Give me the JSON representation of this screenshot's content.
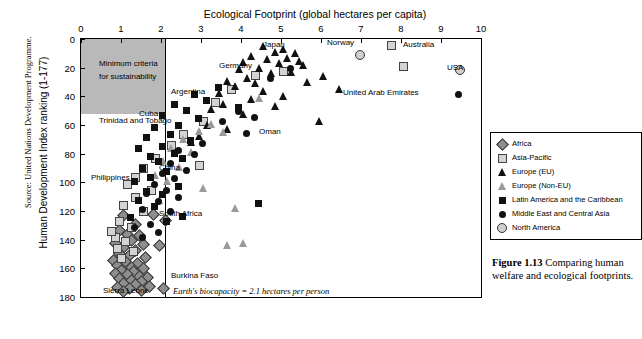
{
  "source": "Source: United Nations Development Programme.",
  "chart_data": {
    "type": "scatter",
    "title": "Ecological Footprint (global hectares per capita)",
    "xlabel": "Ecological Footprint (global hectares per capita)",
    "ylabel": "Human Development Index ranking (1-177)",
    "xlim": [
      0,
      10
    ],
    "ylim": [
      180,
      0
    ],
    "xticks": [
      0,
      1,
      2,
      3,
      4,
      5,
      6,
      7,
      8,
      9,
      10
    ],
    "yticks": [
      0,
      20,
      40,
      60,
      80,
      100,
      120,
      140,
      160,
      180
    ],
    "grid": false,
    "axis_top": true,
    "legend_position": "right",
    "annotations": [
      {
        "text": "Minimum criteria",
        "x": 0.45,
        "y": 14
      },
      {
        "text": "for sustainability",
        "x": 0.45,
        "y": 23
      },
      {
        "text": "Earth's biocapacity = 2.1 hectares per person",
        "x": 2.3,
        "y": 172
      }
    ],
    "reference_lines": [
      {
        "axis": "x",
        "value": 2.1,
        "label": "Earth's biocapacity = 2.1 hectares per person"
      },
      {
        "axis": "y",
        "value": 150,
        "label": "minimum criteria for sustainability"
      }
    ],
    "series": [
      {
        "name": "Africa",
        "marker": "diamond",
        "points": [
          {
            "x": 1.05,
            "y": 123
          },
          {
            "x": 1.35,
            "y": 129
          },
          {
            "x": 0.95,
            "y": 133
          },
          {
            "x": 1.15,
            "y": 136
          },
          {
            "x": 1.45,
            "y": 137
          },
          {
            "x": 1.25,
            "y": 140
          },
          {
            "x": 0.85,
            "y": 142
          },
          {
            "x": 1.55,
            "y": 143
          },
          {
            "x": 1.05,
            "y": 145
          },
          {
            "x": 1.35,
            "y": 147
          },
          {
            "x": 0.95,
            "y": 149
          },
          {
            "x": 1.2,
            "y": 151
          },
          {
            "x": 1.6,
            "y": 152
          },
          {
            "x": 0.8,
            "y": 154
          },
          {
            "x": 1.1,
            "y": 155
          },
          {
            "x": 1.4,
            "y": 156
          },
          {
            "x": 0.9,
            "y": 158
          },
          {
            "x": 1.25,
            "y": 159
          },
          {
            "x": 1.55,
            "y": 160
          },
          {
            "x": 1.0,
            "y": 161
          },
          {
            "x": 1.3,
            "y": 162
          },
          {
            "x": 0.85,
            "y": 163
          },
          {
            "x": 1.15,
            "y": 164
          },
          {
            "x": 1.45,
            "y": 165
          },
          {
            "x": 1.65,
            "y": 166
          },
          {
            "x": 0.95,
            "y": 167
          },
          {
            "x": 1.25,
            "y": 168
          },
          {
            "x": 1.5,
            "y": 169
          },
          {
            "x": 1.05,
            "y": 170
          },
          {
            "x": 1.35,
            "y": 171
          },
          {
            "x": 1.7,
            "y": 172
          },
          {
            "x": 0.9,
            "y": 173
          },
          {
            "x": 1.2,
            "y": 174
          },
          {
            "x": 1.5,
            "y": 175
          },
          {
            "x": 1.05,
            "y": 176
          },
          {
            "x": 2.05,
            "y": 174
          },
          {
            "x": 1.8,
            "y": 122
          },
          {
            "x": 2.1,
            "y": 126
          },
          {
            "x": 1.95,
            "y": 144
          }
        ]
      },
      {
        "name": "Asia-Pacific",
        "marker": "square-lt",
        "points": [
          {
            "x": 7.75,
            "y": 4
          },
          {
            "x": 8.05,
            "y": 19
          },
          {
            "x": 5.05,
            "y": 22
          },
          {
            "x": 4.35,
            "y": 25
          },
          {
            "x": 3.75,
            "y": 35
          },
          {
            "x": 3.35,
            "y": 44
          },
          {
            "x": 3.05,
            "y": 57
          },
          {
            "x": 2.55,
            "y": 66
          },
          {
            "x": 2.25,
            "y": 74
          },
          {
            "x": 1.85,
            "y": 83
          },
          {
            "x": 1.55,
            "y": 90
          },
          {
            "x": 1.35,
            "y": 96
          },
          {
            "x": 1.15,
            "y": 101
          },
          {
            "x": 1.75,
            "y": 105
          },
          {
            "x": 1.35,
            "y": 110
          },
          {
            "x": 1.05,
            "y": 116
          },
          {
            "x": 1.55,
            "y": 120
          },
          {
            "x": 0.95,
            "y": 127
          },
          {
            "x": 1.25,
            "y": 131
          },
          {
            "x": 0.85,
            "y": 138
          },
          {
            "x": 1.1,
            "y": 141
          },
          {
            "x": 0.9,
            "y": 146
          },
          {
            "x": 1.3,
            "y": 148
          },
          {
            "x": 1.0,
            "y": 153
          },
          {
            "x": 0.75,
            "y": 134
          },
          {
            "x": 2.95,
            "y": 88
          }
        ]
      },
      {
        "name": "Europe (EU)",
        "marker": "triangle-dk",
        "points": [
          {
            "x": 4.55,
            "y": 5
          },
          {
            "x": 5.05,
            "y": 7
          },
          {
            "x": 4.85,
            "y": 9
          },
          {
            "x": 5.35,
            "y": 10
          },
          {
            "x": 4.25,
            "y": 12
          },
          {
            "x": 5.15,
            "y": 13
          },
          {
            "x": 4.65,
            "y": 14
          },
          {
            "x": 5.45,
            "y": 15
          },
          {
            "x": 4.05,
            "y": 16
          },
          {
            "x": 4.95,
            "y": 17
          },
          {
            "x": 5.55,
            "y": 18
          },
          {
            "x": 4.45,
            "y": 20
          },
          {
            "x": 3.95,
            "y": 21
          },
          {
            "x": 5.25,
            "y": 23
          },
          {
            "x": 4.75,
            "y": 24
          },
          {
            "x": 6.05,
            "y": 26
          },
          {
            "x": 4.15,
            "y": 27
          },
          {
            "x": 3.65,
            "y": 29
          },
          {
            "x": 5.65,
            "y": 30
          },
          {
            "x": 4.35,
            "y": 31
          },
          {
            "x": 3.85,
            "y": 33
          },
          {
            "x": 6.45,
            "y": 35
          },
          {
            "x": 4.55,
            "y": 36
          },
          {
            "x": 3.45,
            "y": 38
          },
          {
            "x": 5.05,
            "y": 40
          },
          {
            "x": 4.25,
            "y": 42
          },
          {
            "x": 3.55,
            "y": 45
          },
          {
            "x": 4.85,
            "y": 47
          },
          {
            "x": 3.25,
            "y": 49
          },
          {
            "x": 4.05,
            "y": 52
          },
          {
            "x": 5.95,
            "y": 57
          },
          {
            "x": 3.15,
            "y": 60
          },
          {
            "x": 3.65,
            "y": 63
          },
          {
            "x": 2.95,
            "y": 68
          },
          {
            "x": 2.75,
            "y": 72
          }
        ]
      },
      {
        "name": "Europe (Non-EU)",
        "marker": "triangle-gy",
        "points": [
          {
            "x": 4.45,
            "y": 41
          },
          {
            "x": 3.25,
            "y": 59
          },
          {
            "x": 2.95,
            "y": 64
          },
          {
            "x": 3.55,
            "y": 65
          },
          {
            "x": 2.55,
            "y": 70
          },
          {
            "x": 2.25,
            "y": 76
          },
          {
            "x": 2.75,
            "y": 79
          },
          {
            "x": 2.05,
            "y": 85
          },
          {
            "x": 2.45,
            "y": 89
          },
          {
            "x": 1.85,
            "y": 95
          },
          {
            "x": 2.15,
            "y": 99
          },
          {
            "x": 3.05,
            "y": 104
          },
          {
            "x": 3.85,
            "y": 118
          },
          {
            "x": 4.05,
            "y": 142
          },
          {
            "x": 3.65,
            "y": 144
          },
          {
            "x": 1.95,
            "y": 112
          }
        ]
      },
      {
        "name": "Latin America and the Caribbean",
        "marker": "square-dk",
        "points": [
          {
            "x": 3.45,
            "y": 34
          },
          {
            "x": 2.85,
            "y": 39
          },
          {
            "x": 3.15,
            "y": 43
          },
          {
            "x": 2.35,
            "y": 46
          },
          {
            "x": 3.95,
            "y": 48
          },
          {
            "x": 2.65,
            "y": 50
          },
          {
            "x": 2.05,
            "y": 54
          },
          {
            "x": 2.95,
            "y": 56
          },
          {
            "x": 2.45,
            "y": 61
          },
          {
            "x": 1.85,
            "y": 62
          },
          {
            "x": 2.25,
            "y": 67
          },
          {
            "x": 1.65,
            "y": 69
          },
          {
            "x": 2.75,
            "y": 71
          },
          {
            "x": 2.05,
            "y": 75
          },
          {
            "x": 1.45,
            "y": 77
          },
          {
            "x": 2.35,
            "y": 80
          },
          {
            "x": 1.75,
            "y": 82
          },
          {
            "x": 2.55,
            "y": 84
          },
          {
            "x": 1.95,
            "y": 86
          },
          {
            "x": 1.55,
            "y": 91
          },
          {
            "x": 2.15,
            "y": 93
          },
          {
            "x": 1.75,
            "y": 97
          },
          {
            "x": 1.35,
            "y": 100
          },
          {
            "x": 2.45,
            "y": 103
          },
          {
            "x": 1.65,
            "y": 107
          },
          {
            "x": 2.05,
            "y": 109
          },
          {
            "x": 1.45,
            "y": 113
          },
          {
            "x": 1.85,
            "y": 117
          },
          {
            "x": 4.45,
            "y": 115
          },
          {
            "x": 2.55,
            "y": 124
          },
          {
            "x": 1.25,
            "y": 125
          },
          {
            "x": 2.15,
            "y": 128
          }
        ]
      },
      {
        "name": "Middle East and Central Asia",
        "marker": "circle-dk",
        "points": [
          {
            "x": 5.25,
            "y": 21
          },
          {
            "x": 4.75,
            "y": 28
          },
          {
            "x": 3.95,
            "y": 51
          },
          {
            "x": 4.35,
            "y": 55
          },
          {
            "x": 3.55,
            "y": 58
          },
          {
            "x": 4.15,
            "y": 66
          },
          {
            "x": 3.05,
            "y": 73
          },
          {
            "x": 2.45,
            "y": 78
          },
          {
            "x": 2.85,
            "y": 81
          },
          {
            "x": 2.25,
            "y": 87
          },
          {
            "x": 2.65,
            "y": 92
          },
          {
            "x": 2.05,
            "y": 94
          },
          {
            "x": 2.35,
            "y": 98
          },
          {
            "x": 1.85,
            "y": 102
          },
          {
            "x": 2.15,
            "y": 106
          },
          {
            "x": 1.65,
            "y": 108
          },
          {
            "x": 2.45,
            "y": 111
          },
          {
            "x": 1.95,
            "y": 114
          },
          {
            "x": 1.55,
            "y": 119
          },
          {
            "x": 2.25,
            "y": 121
          },
          {
            "x": 1.75,
            "y": 130
          },
          {
            "x": 1.35,
            "y": 132
          },
          {
            "x": 1.95,
            "y": 135
          },
          {
            "x": 1.55,
            "y": 139
          },
          {
            "x": 9.45,
            "y": 39
          }
        ]
      },
      {
        "name": "North America",
        "marker": "circle-gy",
        "points": [
          {
            "x": 9.45,
            "y": 21
          },
          {
            "x": 6.95,
            "y": 11
          }
        ]
      }
    ],
    "point_labels": [
      {
        "text": "Japan",
        "x": 4.55,
        "y": 4
      },
      {
        "text": "Norway",
        "x": 6.15,
        "y": 3
      },
      {
        "text": "Australia",
        "x": 8.05,
        "y": 4
      },
      {
        "text": "USA",
        "x": 9.15,
        "y": 20
      },
      {
        "text": "Germany",
        "x": 3.45,
        "y": 19
      },
      {
        "text": "Argentina",
        "x": 2.25,
        "y": 37
      },
      {
        "text": "United Arab Emirates",
        "x": 6.55,
        "y": 38
      },
      {
        "text": "Cuba",
        "x": 1.45,
        "y": 52
      },
      {
        "text": "Trinidad and Tobago",
        "x": 0.45,
        "y": 57
      },
      {
        "text": "Oman",
        "x": 4.45,
        "y": 65
      },
      {
        "text": "China",
        "x": 1.95,
        "y": 90
      },
      {
        "text": "Philippines",
        "x": 0.25,
        "y": 97
      },
      {
        "text": "South Africa",
        "x": 1.95,
        "y": 122
      },
      {
        "text": "Burkina Faso",
        "x": 2.25,
        "y": 165
      },
      {
        "text": "Sierra Leone",
        "x": 0.55,
        "y": 176
      }
    ]
  },
  "legend": {
    "items": [
      {
        "label": "Africa",
        "marker": "diamond"
      },
      {
        "label": "Asia-Pacific",
        "marker": "square-lt"
      },
      {
        "label": "Europe (EU)",
        "marker": "triangle-dk"
      },
      {
        "label": "Europe (Non-EU)",
        "marker": "triangle-gy"
      },
      {
        "label": "Latin America and the Caribbean",
        "marker": "square-dk"
      },
      {
        "label": "Middle East and Central Asia",
        "marker": "circle-dk"
      },
      {
        "label": "North America",
        "marker": "circle-gy"
      }
    ]
  },
  "caption": {
    "number": "Figure 1.13",
    "text": "Comparing human welfare and ecological footprints."
  }
}
